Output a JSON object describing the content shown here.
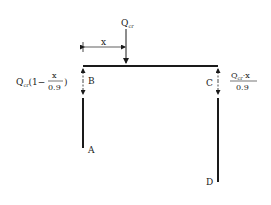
{
  "diagram": {
    "load": {
      "label": "Q",
      "subscript": "cr"
    },
    "dimension": {
      "label": "x"
    },
    "points": {
      "A": "A",
      "B": "B",
      "C": "C",
      "D": "D"
    },
    "left_reaction": {
      "prefix": "Q",
      "subscript": "cr",
      "open": "(1−",
      "numerator": "x",
      "denominator": "0.9",
      "close": ")"
    },
    "right_reaction": {
      "prefix": "Q",
      "subscript": "cr",
      "numerator_tail": "·x",
      "denominator": "0.9"
    },
    "colors": {
      "ink": "#1a1a1a",
      "background": "#ffffff"
    }
  }
}
